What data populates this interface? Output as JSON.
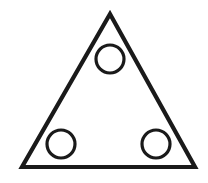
{
  "figure": {
    "name": "triangle-with-three-circles",
    "width": 208,
    "height": 183,
    "background_color": "#ffffff",
    "stroke_color": "#1a1a1a"
  },
  "chart_data": {
    "type": "diagram",
    "title": "",
    "xlabel": "",
    "ylabel": "",
    "grid": false,
    "legend": null,
    "shapes": [
      {
        "id": "triangle",
        "kind": "polygon",
        "label": "triangle",
        "points": [
          [
            110,
            14
          ],
          [
            195,
            167
          ],
          [
            22,
            167
          ]
        ],
        "points_string": "110,14 195,167 22,167",
        "stroke": "#1a1a1a",
        "stroke_width": 4.2,
        "fill": "none"
      },
      {
        "id": "circle-top",
        "kind": "circle",
        "label": "top circle",
        "cx": 110,
        "cy": 59,
        "r": 14,
        "stroke": "#1a1a1a",
        "stroke_width": 3.2,
        "fill": "none"
      },
      {
        "id": "circle-bottom-left",
        "kind": "circle",
        "label": "bottom left circle",
        "cx": 61,
        "cy": 144,
        "r": 14,
        "stroke": "#1a1a1a",
        "stroke_width": 3.2,
        "fill": "none"
      },
      {
        "id": "circle-bottom-right",
        "kind": "circle",
        "label": "bottom right circle",
        "cx": 156,
        "cy": 144,
        "r": 14,
        "stroke": "#1a1a1a",
        "stroke_width": 3.2,
        "fill": "none"
      }
    ],
    "counts": {
      "triangles": 1,
      "circles": 3
    }
  }
}
